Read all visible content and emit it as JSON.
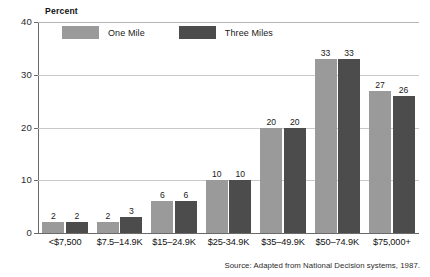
{
  "chart_data": {
    "type": "bar",
    "title": "",
    "ylabel": "Percent",
    "xlabel": "",
    "ylim": [
      0,
      40
    ],
    "yticks": [
      0,
      10,
      20,
      30,
      40
    ],
    "grid": true,
    "legend_position": "top-left",
    "categories": [
      "<$7,500",
      "$7.5–14.9K",
      "$15–24.9K",
      "$25-34.9K",
      "$35–49.9K",
      "$50–74.9K",
      "$75,000+"
    ],
    "series": [
      {
        "name": "One Mile",
        "color": "#9a9a9a",
        "values": [
          2,
          2,
          6,
          10,
          20,
          33,
          27
        ]
      },
      {
        "name": "Three Miles",
        "color": "#4c4c4c",
        "values": [
          2,
          3,
          6,
          10,
          20,
          33,
          26
        ]
      }
    ],
    "annotations": {
      "source": "Source: Adapted from National Decision systems, 1987."
    }
  },
  "colors": {
    "one_mile": "#9a9a9a",
    "three_miles": "#4c4c4c",
    "axis": "#6a6a6a",
    "grid": "#c9c9c9",
    "text": "#1a1a1a"
  }
}
